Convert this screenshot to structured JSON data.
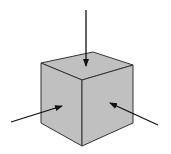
{
  "diagram": {
    "colors": {
      "background": "#ffffff",
      "face_fill": "#c0c0c0",
      "edge": "#333333",
      "arrow": "#111111"
    },
    "cube": {
      "top_face": "41,63 93,52 133,65 82,80",
      "left_face": "41,63 82,80 82,146 41,123",
      "right_face": "82,80 133,65 133,123 82,146"
    },
    "arrows": [
      {
        "name": "top-arrow",
        "x1": 86,
        "y1": 10,
        "x2": 86,
        "y2": 66
      },
      {
        "name": "left-arrow",
        "x1": 11,
        "y1": 122,
        "x2": 62,
        "y2": 106
      },
      {
        "name": "right-arrow",
        "x1": 158,
        "y1": 125,
        "x2": 110,
        "y2": 103
      }
    ]
  }
}
